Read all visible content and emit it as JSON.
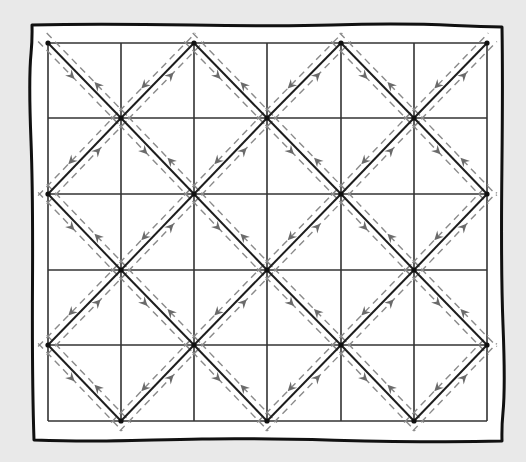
{
  "diagram": {
    "type": "quilt-seam-diagram",
    "grid": {
      "columns": 6,
      "rows": 5,
      "x_lines": [
        48,
        121,
        194,
        267,
        341,
        414,
        487
      ],
      "y_lines": [
        43,
        118,
        194,
        270,
        345,
        421
      ]
    },
    "nodes_rule": "diagonal nodes at grid intersections where (col + row) is even",
    "seam_offset": 6,
    "colors": {
      "background": "#e9e9e9",
      "panel": "#ffffff",
      "border": "#111111",
      "grid_line": "#333333",
      "diagonal_line": "#1e1e1e",
      "dashed_line": "#8a8a8a",
      "arrow": "#6a6a6a",
      "node": "#111111"
    },
    "border": {
      "left": 32,
      "top": 25,
      "right": 502,
      "bottom": 441
    },
    "icons": {
      "arrow": "arrowhead-icon",
      "node": "node-dot-icon"
    }
  }
}
